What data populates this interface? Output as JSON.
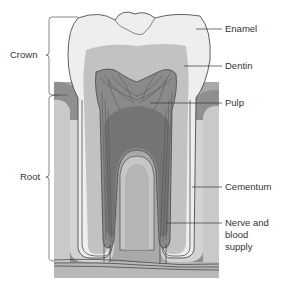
{
  "labels": {
    "crown": "Crown",
    "root": "Root",
    "enamel": "Enamel",
    "dentin": "Dentin",
    "pulp": "Pulp",
    "cementum": "Cementum",
    "nerve_line1": "Nerve and",
    "nerve_line2": "blood",
    "nerve_line3": "supply"
  },
  "colors": {
    "background": "#ffffff",
    "bone": "#a9a9a9",
    "bone_light": "#c9c9c9",
    "gum": "#8f8f8f",
    "enamel": "#eeeeee",
    "dentin": "#c2c2c2",
    "pulp": "#7d7d7d",
    "pulp_light": "#9a9a9a",
    "cementum": "#b3b3b3",
    "outline": "#3a3a3a",
    "text": "#333333"
  }
}
